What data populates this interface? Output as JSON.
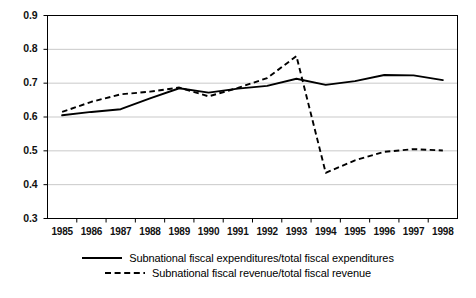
{
  "chart_data": {
    "type": "line",
    "title": "",
    "subtitle": "",
    "xlabel": "",
    "ylabel": "",
    "grid": true,
    "legend_position": "bottom",
    "ylim": [
      0.3,
      0.9
    ],
    "yticks": [
      "0.9",
      "0.8",
      "0.7",
      "0.6",
      "0.5",
      "0.4",
      "0.3"
    ],
    "ytick_values": [
      0.9,
      0.8,
      0.7,
      0.6,
      0.5,
      0.4,
      0.3
    ],
    "categories": [
      "1985",
      "1986",
      "1987",
      "1988",
      "1989",
      "1990",
      "1991",
      "1992",
      "1993",
      "1994",
      "1995",
      "1996",
      "1997",
      "1998"
    ],
    "x": [
      1985,
      1986,
      1987,
      1988,
      1989,
      1990,
      1991,
      1992,
      1993,
      1994,
      1995,
      1996,
      1997,
      1998
    ],
    "series": [
      {
        "name": "Subnational fiscal expenditures/total fiscal expenditures",
        "style": "solid",
        "color": "#000000",
        "values": [
          0.605,
          0.615,
          0.623,
          0.655,
          0.685,
          0.672,
          0.684,
          0.692,
          0.713,
          0.695,
          0.706,
          0.724,
          0.723,
          0.709
        ]
      },
      {
        "name": "Subnational fiscal revenue/total fiscal revenue",
        "style": "dashed",
        "color": "#000000",
        "values": [
          0.615,
          0.645,
          0.667,
          0.675,
          0.687,
          0.661,
          0.686,
          0.715,
          0.78,
          0.435,
          0.472,
          0.497,
          0.505,
          0.501
        ]
      }
    ]
  },
  "legend": {
    "items": [
      {
        "label": "Subnational fiscal expenditures/total fiscal expenditures",
        "style": "solid"
      },
      {
        "label": "Subnational fiscal revenue/total fiscal revenue",
        "style": "dashed"
      }
    ]
  },
  "colors": {
    "line": "#000000",
    "grid": "#c9c9c9",
    "axis": "#000000",
    "background": "#ffffff"
  }
}
